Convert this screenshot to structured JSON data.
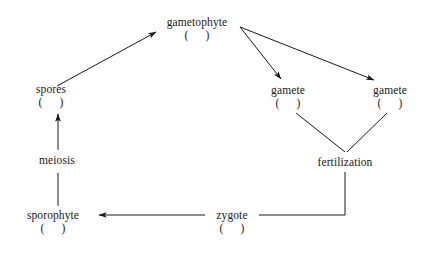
{
  "diagram": {
    "background_color": "#ffffff",
    "line_color": "#1a1a1a",
    "text_color": "#1a1a1a",
    "nodes": [
      {
        "id": "gametophyte",
        "label": "gametophyte",
        "ploidy_open": "(",
        "ploidy_value": "",
        "ploidy_close": ")",
        "has_ploidy": true
      },
      {
        "id": "spores",
        "label": "spores",
        "ploidy_open": "(",
        "ploidy_value": "",
        "ploidy_close": ")",
        "has_ploidy": true
      },
      {
        "id": "gamete-left",
        "label": "gamete",
        "ploidy_open": "(",
        "ploidy_value": "",
        "ploidy_close": ")",
        "has_ploidy": true
      },
      {
        "id": "gamete-right",
        "label": "gamete",
        "ploidy_open": "(",
        "ploidy_value": "",
        "ploidy_close": ")",
        "has_ploidy": true
      },
      {
        "id": "meiosis",
        "label": "meiosis",
        "has_ploidy": false
      },
      {
        "id": "fertilization",
        "label": "fertilization",
        "has_ploidy": false
      },
      {
        "id": "sporophyte",
        "label": "sporophyte",
        "ploidy_open": "(",
        "ploidy_value": "",
        "ploidy_close": ")",
        "has_ploidy": true
      },
      {
        "id": "zygote",
        "label": "zygote",
        "ploidy_open": "(",
        "ploidy_value": "",
        "ploidy_close": ")",
        "has_ploidy": true
      }
    ],
    "connectors": [
      {
        "id": "spores-to-gametophyte",
        "arrow": true
      },
      {
        "id": "gametophyte-to-gamete-left",
        "arrow": true
      },
      {
        "id": "gametophyte-to-gamete-right",
        "arrow": true
      },
      {
        "id": "gamete-left-to-fertilization",
        "arrow": false
      },
      {
        "id": "gamete-right-to-fertilization",
        "arrow": false
      },
      {
        "id": "fertilization-to-zygote",
        "arrow": false
      },
      {
        "id": "zygote-to-sporophyte",
        "arrow": true
      },
      {
        "id": "sporophyte-through-meiosis-to-spores",
        "arrow": true
      }
    ]
  }
}
